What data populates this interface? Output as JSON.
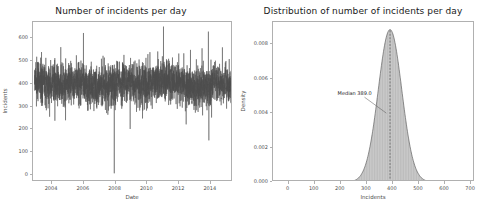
{
  "figure": {
    "width": 484,
    "height": 218,
    "background": "#ffffff",
    "series_color": "#4d4d4d",
    "fill_color": "#9a9a9a",
    "axis_color": "#b0b0b0",
    "text_color": "#4d4d4d",
    "title_color": "#1a1a1a"
  },
  "chart_data": [
    {
      "type": "line",
      "panel": "left",
      "title": "Number of incidents per day",
      "xlabel": "Date",
      "ylabel": "Incidents",
      "xlim": [
        2002.8,
        2015.4
      ],
      "ylim": [
        -30,
        670
      ],
      "grid": false,
      "legend": "none",
      "xticks": [
        2004,
        2006,
        2008,
        2010,
        2012,
        2014
      ],
      "xtick_labels": [
        "2004",
        "2006",
        "2008",
        "2010",
        "2012",
        "2014"
      ],
      "yticks": [
        0,
        100,
        200,
        300,
        400,
        500,
        600
      ],
      "ytick_labels": [
        "0",
        "100",
        "200",
        "300",
        "400",
        "500",
        "600"
      ],
      "description": "Dense daily time series of incident counts, roughly stationary around 400 with noise band 300-500, occasional spikes above 600 and rare drops near 0 (notably in 2008).",
      "noise_mean": 400,
      "noise_sd": 45,
      "x": [
        2002.9,
        2002.95,
        2003.0,
        2003.05,
        2003.1,
        2003.15,
        2003.2,
        2003.25,
        2003.3,
        2003.35,
        2003.4,
        2003.45,
        2003.5,
        2003.55,
        2003.6,
        2003.65,
        2003.7,
        2003.75,
        2003.8,
        2003.85,
        2003.9,
        2003.95,
        2004.0,
        2004.05,
        2004.1,
        2004.15,
        2004.2,
        2004.25,
        2004.3,
        2004.35,
        2004.4,
        2004.45,
        2004.5,
        2004.55,
        2004.6,
        2004.65,
        2004.7,
        2004.75,
        2004.8,
        2004.85,
        2004.9,
        2004.95,
        2005.0,
        2005.05,
        2005.1,
        2005.15,
        2005.2,
        2005.25,
        2005.3,
        2005.35,
        2005.4,
        2005.45,
        2005.5,
        2005.55,
        2005.6,
        2005.65,
        2005.7,
        2005.75,
        2005.8,
        2005.85,
        2005.9,
        2005.95,
        2006.0,
        2006.05,
        2006.1,
        2006.15,
        2006.2,
        2006.25,
        2006.3,
        2006.35,
        2006.4,
        2006.45,
        2006.5,
        2006.55,
        2006.6,
        2006.65,
        2006.7,
        2006.75,
        2006.8,
        2006.85,
        2006.9,
        2006.95,
        2007.0,
        2007.05,
        2007.1,
        2007.15,
        2007.2,
        2007.25,
        2007.3,
        2007.35,
        2007.4,
        2007.45,
        2007.5,
        2007.55,
        2007.6,
        2007.65,
        2007.7,
        2007.75,
        2007.8,
        2007.85,
        2007.9,
        2007.95,
        2008.0,
        2008.05,
        2008.1,
        2008.15,
        2008.2,
        2008.25,
        2008.3,
        2008.35,
        2008.4,
        2008.45,
        2008.5,
        2008.55,
        2008.6,
        2008.65,
        2008.7,
        2008.75,
        2008.8,
        2008.85,
        2008.9,
        2008.95,
        2009.0,
        2009.05,
        2009.1,
        2009.15,
        2009.2,
        2009.25,
        2009.3,
        2009.35,
        2009.4,
        2009.45,
        2009.5,
        2009.55,
        2009.6,
        2009.65,
        2009.7,
        2009.75,
        2009.8,
        2009.85,
        2009.9,
        2009.95,
        2010.0,
        2010.05,
        2010.1,
        2010.15,
        2010.2,
        2010.25,
        2010.3,
        2010.35,
        2010.4,
        2010.45,
        2010.5,
        2010.55,
        2010.6,
        2010.65,
        2010.7,
        2010.75,
        2010.8,
        2010.85,
        2010.9,
        2010.95,
        2011.0,
        2011.05,
        2011.1,
        2011.15,
        2011.2,
        2011.25,
        2011.3,
        2011.35,
        2011.4,
        2011.45,
        2011.5,
        2011.55,
        2011.6,
        2011.65,
        2011.7,
        2011.75,
        2011.8,
        2011.85,
        2011.9,
        2011.95,
        2012.0,
        2012.05,
        2012.1,
        2012.15,
        2012.2,
        2012.25,
        2012.3,
        2012.35,
        2012.4,
        2012.45,
        2012.5,
        2012.55,
        2012.6,
        2012.65,
        2012.7,
        2012.75,
        2012.8,
        2012.85,
        2012.9,
        2012.95,
        2013.0,
        2013.05,
        2013.1,
        2013.15,
        2013.2,
        2013.25,
        2013.3,
        2013.35,
        2013.4,
        2013.45,
        2013.5,
        2013.55,
        2013.6,
        2013.65,
        2013.7,
        2013.75,
        2013.8,
        2013.85,
        2013.9,
        2013.95,
        2014.0,
        2014.05,
        2014.1,
        2014.15,
        2014.2,
        2014.25,
        2014.3,
        2014.35,
        2014.4,
        2014.45,
        2014.5,
        2014.55,
        2014.6,
        2014.65,
        2014.7,
        2014.75,
        2014.8,
        2014.85,
        2014.9,
        2014.95,
        2015.0,
        2015.05,
        2015.1,
        2015.15,
        2015.2,
        2015.25,
        2015.3
      ],
      "spikes_high": [
        {
          "x": 2005.98,
          "y": 622
        },
        {
          "x": 2011.02,
          "y": 650
        },
        {
          "x": 2013.85,
          "y": 628
        },
        {
          "x": 2004.55,
          "y": 560
        },
        {
          "x": 2012.72,
          "y": 548
        },
        {
          "x": 2013.45,
          "y": 555
        },
        {
          "x": 2012.3,
          "y": 533
        },
        {
          "x": 2010.95,
          "y": 520
        }
      ],
      "spikes_low": [
        {
          "x": 2007.92,
          "y": 8
        },
        {
          "x": 2013.88,
          "y": 152
        },
        {
          "x": 2008.92,
          "y": 202
        },
        {
          "x": 2004.18,
          "y": 238
        },
        {
          "x": 2004.85,
          "y": 240
        },
        {
          "x": 2009.7,
          "y": 248
        },
        {
          "x": 2012.45,
          "y": 222
        },
        {
          "x": 2014.05,
          "y": 252
        }
      ]
    },
    {
      "type": "area",
      "panel": "right",
      "title": "Distribution of number of incidents per day",
      "xlabel": "Incidents",
      "ylabel": "Density",
      "xlim": [
        -60,
        715
      ],
      "ylim": [
        0,
        0.0093
      ],
      "grid": false,
      "legend": "none",
      "xticks": [
        0,
        100,
        200,
        300,
        400,
        500,
        600,
        700
      ],
      "xtick_labels": [
        "0",
        "100",
        "200",
        "300",
        "400",
        "500",
        "600",
        "700"
      ],
      "yticks": [
        0.0,
        0.002,
        0.004,
        0.006,
        0.008
      ],
      "ytick_labels": [
        "0.000",
        "0.002",
        "0.004",
        "0.006",
        "0.008"
      ],
      "distribution": {
        "kind": "kde-normal",
        "mean": 389.0,
        "sd": 45.0,
        "peak_density": 0.00886
      },
      "annotation": {
        "text": "Median  389.0",
        "value": 389.0,
        "text_x": 253,
        "text_y": 0.00505,
        "arrow_to_x": 375,
        "arrow_to_y": 0.004
      },
      "median_line": {
        "x": 389.0,
        "style": "dashed",
        "color": "#555555"
      }
    }
  ]
}
